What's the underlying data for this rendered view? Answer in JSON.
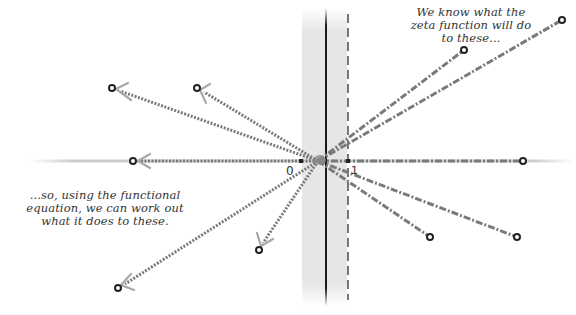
{
  "annotations": {
    "top_right": {
      "lines": [
        "We know what the",
        "zeta function will do",
        "to these..."
      ]
    },
    "bottom_left": {
      "lines": [
        "...so, using the functional",
        "equation, we can work out",
        "what it does to these."
      ]
    }
  },
  "axis_labels": {
    "zero": "0",
    "one": "1"
  },
  "colors": {
    "strip_fill": "#e4e4e4",
    "critical_line": "#1a1a1a",
    "dashed_line": "#555555",
    "ray": "#7a7a7a",
    "arrowhead": "#aaaaaa",
    "point_stroke": "#222222"
  },
  "geometry": {
    "center": [
      318,
      161
    ],
    "axis_y": 161,
    "strip": {
      "x0": 302,
      "x1": 347,
      "critical_line_x": 326,
      "re_one_x": 348
    },
    "right_points": [
      [
        464,
        50
      ],
      [
        562,
        20
      ],
      [
        523,
        161
      ],
      [
        430,
        237
      ],
      [
        517,
        237
      ]
    ],
    "left_points": [
      [
        112,
        88
      ],
      [
        197,
        88
      ],
      [
        133,
        161
      ],
      [
        259,
        250
      ],
      [
        118,
        288
      ]
    ]
  }
}
